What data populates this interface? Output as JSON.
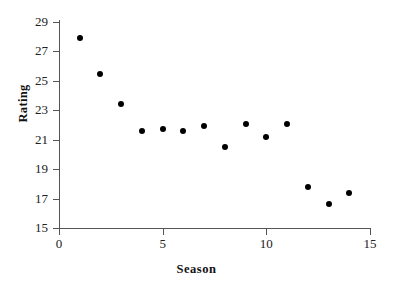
{
  "chart_data": {
    "type": "scatter",
    "title": "",
    "xlabel": "Season",
    "ylabel": "Rating",
    "xlim": [
      0,
      15
    ],
    "ylim": [
      15,
      29
    ],
    "xticks": [
      0,
      5,
      10,
      15
    ],
    "xtick_labels": [
      "0",
      "5",
      "10",
      "15"
    ],
    "yticks": [
      15,
      17,
      19,
      21,
      23,
      25,
      27,
      29
    ],
    "ytick_labels": [
      "15",
      "17",
      "19",
      "21",
      "23",
      "25",
      "27",
      "29"
    ],
    "grid": false,
    "legend": null,
    "marker": "filled-circle",
    "marker_color": "#000000",
    "x": [
      1,
      2,
      3,
      4,
      5,
      6,
      7,
      8,
      9,
      10,
      11,
      12,
      13,
      14
    ],
    "values": [
      27.9,
      25.5,
      23.4,
      21.6,
      21.7,
      21.6,
      21.9,
      20.5,
      22.1,
      21.2,
      22.1,
      17.8,
      16.6,
      17.4
    ],
    "points": [
      {
        "x": 1,
        "y": 27.9
      },
      {
        "x": 2,
        "y": 25.5
      },
      {
        "x": 3,
        "y": 23.4
      },
      {
        "x": 4,
        "y": 21.6
      },
      {
        "x": 5,
        "y": 21.7
      },
      {
        "x": 6,
        "y": 21.6
      },
      {
        "x": 7,
        "y": 21.9
      },
      {
        "x": 8,
        "y": 20.5
      },
      {
        "x": 9,
        "y": 22.1
      },
      {
        "x": 10,
        "y": 21.2
      },
      {
        "x": 11,
        "y": 22.1
      },
      {
        "x": 12,
        "y": 17.8
      },
      {
        "x": 13,
        "y": 16.6
      },
      {
        "x": 14,
        "y": 17.4
      }
    ]
  },
  "colors": {
    "background": "#ffffff",
    "axis": "#555555",
    "text": "#222222",
    "marker": "#000000"
  }
}
